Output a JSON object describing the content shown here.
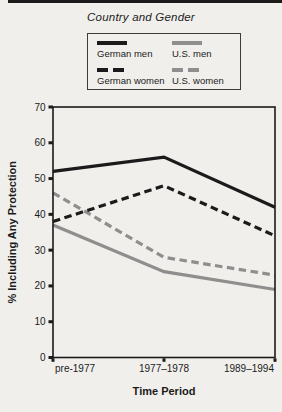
{
  "figure": {
    "background": "#f0efec",
    "ink_color": "#1b1b1b",
    "gray_color": "#8e8e8e"
  },
  "legend": {
    "title": "Country and Gender",
    "entries": [
      {
        "label": "German men",
        "color": "#1b1b1b",
        "style": "solid"
      },
      {
        "label": "U.S. men",
        "color": "#8e8e8e",
        "style": "solid"
      },
      {
        "label": "German women",
        "color": "#1b1b1b",
        "style": "dashed"
      },
      {
        "label": "U.S. women",
        "color": "#8e8e8e",
        "style": "dashed"
      }
    ]
  },
  "chart_data": {
    "type": "line",
    "title": "Country and Gender",
    "categories": [
      "pre-1977",
      "1977–1978",
      "1989–1994"
    ],
    "series": [
      {
        "name": "German men",
        "values": [
          52,
          56,
          42
        ],
        "color": "#1b1b1b",
        "dash": "solid"
      },
      {
        "name": "German women",
        "values": [
          38,
          48,
          34
        ],
        "color": "#1b1b1b",
        "dash": "dashed"
      },
      {
        "name": "U.S. men",
        "values": [
          37,
          24,
          19
        ],
        "color": "#8e8e8e",
        "dash": "solid"
      },
      {
        "name": "U.S. women",
        "values": [
          46,
          28,
          23
        ],
        "color": "#8e8e8e",
        "dash": "dashed"
      }
    ],
    "xlabel": "Time Period",
    "ylabel": "% Including Any Protection",
    "ylim": [
      0,
      70
    ],
    "yticks": [
      0,
      10,
      20,
      30,
      40,
      50,
      60,
      70
    ],
    "grid": false,
    "legend_position": "top"
  }
}
